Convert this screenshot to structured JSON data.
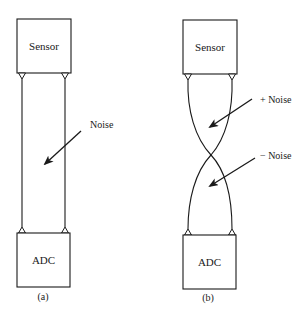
{
  "diagram": {
    "panels": [
      {
        "id": "a",
        "caption": "(a)",
        "top_block": "Sensor",
        "bottom_block": "ADC",
        "wiring": "parallel",
        "annotations": [
          {
            "label": "Noise"
          }
        ]
      },
      {
        "id": "b",
        "caption": "(b)",
        "top_block": "Sensor",
        "bottom_block": "ADC",
        "wiring": "twisted",
        "annotations": [
          {
            "label": "+ Noise"
          },
          {
            "label": "− Noise"
          }
        ]
      }
    ],
    "colors": {
      "stroke": "#1a1a1a",
      "background": "#ffffff"
    }
  }
}
